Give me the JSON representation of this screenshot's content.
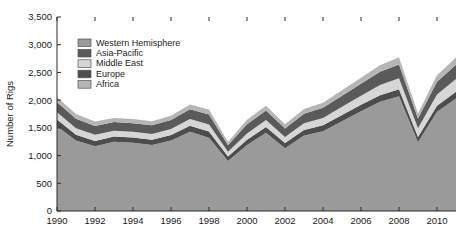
{
  "chart_data": {
    "type": "area",
    "title": "",
    "xlabel": "",
    "ylabel": "Number of Rigs",
    "xlim": [
      1990,
      2011
    ],
    "ylim": [
      0,
      3500
    ],
    "grid": false,
    "stacked": true,
    "legend_position": "top-left-inside",
    "x": [
      1990,
      1991,
      1992,
      1993,
      1994,
      1995,
      1996,
      1997,
      1998,
      1999,
      2000,
      2001,
      2002,
      2003,
      2004,
      2005,
      2006,
      2007,
      2008,
      2009,
      2010,
      2011
    ],
    "xticks": [
      1990,
      1992,
      1994,
      1996,
      1998,
      2000,
      2002,
      2004,
      2006,
      2008,
      2010
    ],
    "xtick_labels": [
      "1990",
      "1992",
      "1994",
      "1996",
      "1998",
      "2000",
      "2002",
      "2004",
      "2006",
      "2008",
      "2010"
    ],
    "yticks": [
      0,
      500,
      1000,
      1500,
      2000,
      2500,
      3000,
      3500
    ],
    "ytick_labels": [
      "0",
      "500",
      "1,000",
      "1,500",
      "2,000",
      "2,500",
      "3,000",
      "3,500"
    ],
    "series": [
      {
        "name": "Western Hemisphere",
        "color": "#9a9a9a",
        "values": [
          1530,
          1270,
          1170,
          1250,
          1230,
          1190,
          1270,
          1430,
          1320,
          900,
          1190,
          1410,
          1130,
          1360,
          1440,
          1620,
          1800,
          1970,
          2070,
          1240,
          1790,
          2030
        ]
      },
      {
        "name": "Europe",
        "color": "#4d4d4d",
        "values": [
          120,
          105,
          95,
          95,
          95,
          95,
          100,
          110,
          115,
          85,
          95,
          105,
          95,
          100,
          105,
          110,
          115,
          120,
          125,
          95,
          110,
          120
        ]
      },
      {
        "name": "Middle East",
        "color": "#d6d6d6",
        "values": [
          130,
          120,
          110,
          105,
          105,
          105,
          110,
          120,
          125,
          85,
          115,
          125,
          110,
          125,
          135,
          150,
          165,
          185,
          200,
          160,
          200,
          230
        ]
      },
      {
        "name": "Asia-Pacific",
        "color": "#5a5a5a",
        "values": [
          180,
          170,
          160,
          155,
          155,
          155,
          160,
          175,
          180,
          115,
          165,
          175,
          155,
          170,
          185,
          200,
          215,
          235,
          250,
          175,
          230,
          260
        ]
      },
      {
        "name": "Africa",
        "color": "#b5b5b5",
        "values": [
          90,
          85,
          80,
          75,
          75,
          75,
          80,
          85,
          90,
          60,
          80,
          85,
          75,
          85,
          90,
          100,
          110,
          120,
          130,
          90,
          120,
          130
        ]
      }
    ],
    "totals": [
      2050,
      1750,
      1615,
      1680,
      1660,
      1620,
      1720,
      1920,
      1830,
      1245,
      1645,
      1900,
      1565,
      1840,
      1955,
      2180,
      2405,
      2630,
      2775,
      1760,
      2450,
      2770
    ]
  },
  "legend": {
    "items": [
      {
        "label": "Western Hemisphere"
      },
      {
        "label": "Asia-Pacific"
      },
      {
        "label": "Middle East"
      },
      {
        "label": "Europe"
      },
      {
        "label": "Africa"
      }
    ]
  }
}
